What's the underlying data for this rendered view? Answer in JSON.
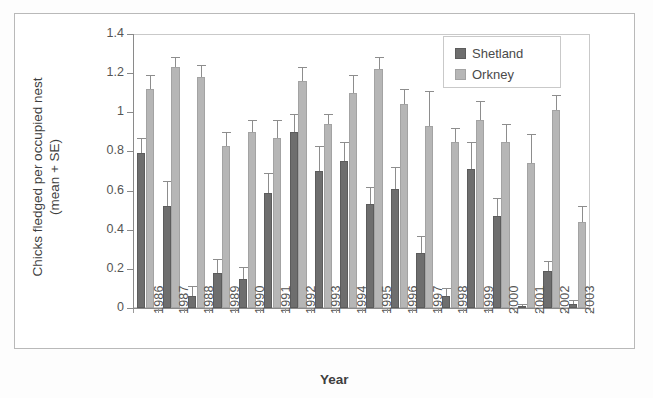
{
  "chart_data": {
    "type": "bar",
    "title": "",
    "xlabel": "Year",
    "ylabel": "Chicks fledged per occupied nest (mean + SE)",
    "ylabel_line1": "Chicks fledged per occupied nest",
    "ylabel_line2": "(mean + SE)",
    "ylim": [
      0,
      1.4
    ],
    "ytick_labels": [
      "0",
      "0.2",
      "0.4",
      "0.6",
      "0.8",
      "1",
      "1.2",
      "1.4"
    ],
    "ytick_values": [
      0,
      0.2,
      0.4,
      0.6,
      0.8,
      1.0,
      1.2,
      1.4
    ],
    "grid": false,
    "legend_position": "top-right",
    "categories": [
      "1986",
      "1987",
      "1988",
      "1989",
      "1990",
      "1991",
      "1992",
      "1993",
      "1994",
      "1995",
      "1996",
      "1997",
      "1998",
      "1999",
      "2000",
      "2001",
      "2002",
      "2003"
    ],
    "series": [
      {
        "name": "Shetland",
        "color": "#6e6e6e",
        "values": [
          0.79,
          0.52,
          0.06,
          0.18,
          0.15,
          0.59,
          0.9,
          0.7,
          0.75,
          0.53,
          0.61,
          0.28,
          0.06,
          0.71,
          0.47,
          0.01,
          0.19,
          0.02
        ],
        "errors": [
          0.08,
          0.13,
          0.05,
          0.07,
          0.06,
          0.1,
          0.09,
          0.13,
          0.1,
          0.09,
          0.11,
          0.09,
          0.04,
          0.14,
          0.09,
          0.01,
          0.05,
          0.02
        ]
      },
      {
        "name": "Orkney",
        "color": "#b6b6b6",
        "values": [
          1.12,
          1.23,
          1.18,
          0.83,
          0.9,
          0.87,
          1.16,
          0.94,
          1.1,
          1.22,
          1.04,
          0.93,
          0.85,
          0.96,
          0.85,
          0.74,
          1.01,
          0.44
        ],
        "errors": [
          0.07,
          0.05,
          0.06,
          0.07,
          0.06,
          0.09,
          0.07,
          0.05,
          0.09,
          0.06,
          0.08,
          0.18,
          0.07,
          0.1,
          0.09,
          0.15,
          0.08,
          0.08
        ]
      }
    ]
  },
  "legend": {
    "items": [
      {
        "label": "Shetland",
        "swatch": "shetland"
      },
      {
        "label": "Orkney",
        "swatch": "orkney"
      }
    ]
  },
  "axis": {
    "x_title": "Year",
    "y_title_line1": "Chicks fledged per occupied nest",
    "y_title_line2": "(mean + SE)"
  },
  "colors": {
    "shetland": "#6e6e6e",
    "orkney": "#b6b6b6",
    "axis": "#8a8a8a",
    "frame": "#b9b9b9",
    "text": "#4a4a4a"
  }
}
